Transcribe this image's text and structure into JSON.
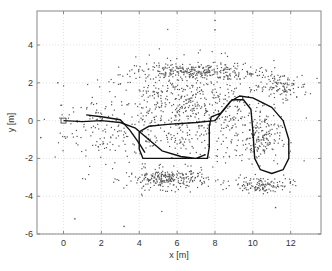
{
  "chart_data": {
    "type": "scatter",
    "title": "",
    "xlabel": "x [m]",
    "ylabel": "y [m]",
    "xlim": [
      -1.4,
      13.6
    ],
    "ylim": [
      -6,
      5.8
    ],
    "xticks": [
      0,
      2,
      4,
      6,
      8,
      10,
      12
    ],
    "yticks": [
      -6,
      -4,
      -2,
      0,
      2,
      4
    ],
    "grid": true,
    "legend": null,
    "series": [
      {
        "name": "landmarks",
        "kind": "scatter",
        "color": "#555555",
        "note": "dense point cloud of ~2000 landmark estimates, approximated by clusters",
        "clusters": [
          {
            "cx": 6.5,
            "cy": 0.5,
            "sx": 3.8,
            "sy": 2.2,
            "n": 700
          },
          {
            "cx": 7.0,
            "cy": 2.6,
            "sx": 2.6,
            "sy": 0.35,
            "n": 260
          },
          {
            "cx": 11.5,
            "cy": 1.8,
            "sx": 1.2,
            "sy": 0.6,
            "n": 120
          },
          {
            "cx": 5.5,
            "cy": -3.1,
            "sx": 1.8,
            "sy": 0.45,
            "n": 260
          },
          {
            "cx": 10.5,
            "cy": -3.4,
            "sx": 1.3,
            "sy": 0.35,
            "n": 130
          },
          {
            "cx": 10.3,
            "cy": -1.0,
            "sx": 1.0,
            "sy": 1.0,
            "n": 160
          },
          {
            "cx": 1.5,
            "cy": -0.5,
            "sx": 1.6,
            "sy": 1.8,
            "n": 90
          }
        ],
        "outliers": [
          [
            8.0,
            5.3
          ],
          [
            8.0,
            4.8
          ],
          [
            -0.3,
            2.0
          ],
          [
            0.6,
            -5.2
          ],
          [
            3.2,
            -5.6
          ],
          [
            11.2,
            -4.6
          ],
          [
            -1.2,
            -0.9
          ]
        ]
      },
      {
        "name": "estimated trajectory",
        "kind": "line",
        "color": "#111111",
        "points": [
          [
            0,
            0
          ],
          [
            1.0,
            -0.05
          ],
          [
            2.0,
            0.0
          ],
          [
            3.0,
            -0.1
          ],
          [
            3.8,
            -0.4
          ],
          [
            4.5,
            -1.0
          ],
          [
            5.2,
            -1.6
          ],
          [
            6.2,
            -1.9
          ],
          [
            7.0,
            -2.0
          ],
          [
            7.6,
            -2.0
          ],
          [
            7.7,
            -1.4
          ],
          [
            7.7,
            -0.3
          ],
          [
            7.8,
            0.2
          ],
          [
            8.3,
            0.4
          ],
          [
            8.8,
            1.0
          ],
          [
            9.3,
            1.3
          ],
          [
            10.0,
            1.2
          ],
          [
            11.0,
            0.7
          ],
          [
            11.6,
            0.0
          ],
          [
            11.9,
            -1.0
          ],
          [
            11.9,
            -2.0
          ],
          [
            11.6,
            -2.6
          ],
          [
            11.0,
            -2.8
          ],
          [
            10.4,
            -2.6
          ],
          [
            10.1,
            -2.0
          ],
          [
            10.0,
            -0.5
          ],
          [
            9.9,
            0.6
          ],
          [
            9.5,
            1.1
          ],
          [
            8.9,
            1.1
          ],
          [
            8.5,
            0.6
          ],
          [
            8.0,
            0.0
          ],
          [
            7.0,
            -0.1
          ],
          [
            5.5,
            -0.2
          ],
          [
            4.5,
            -0.3
          ],
          [
            4.0,
            -0.6
          ],
          [
            4.0,
            -1.5
          ],
          [
            4.2,
            -2.0
          ],
          [
            5.5,
            -2.0
          ],
          [
            7.0,
            -2.0
          ],
          [
            7.5,
            -1.8
          ]
        ],
        "second_pass": [
          [
            1.2,
            0.3
          ],
          [
            2.0,
            0.2
          ],
          [
            3.0,
            0.05
          ],
          [
            3.5,
            -0.5
          ],
          [
            4.0,
            -1.2
          ],
          [
            4.3,
            -1.7
          ]
        ]
      }
    ],
    "markers": [
      {
        "name": "start",
        "x": 0,
        "y": 0,
        "shape": "square"
      }
    ]
  }
}
